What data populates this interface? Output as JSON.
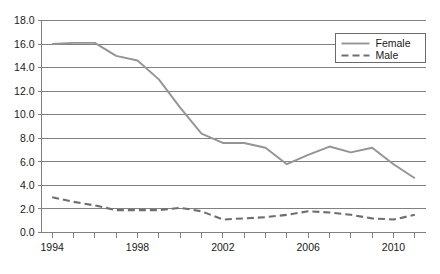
{
  "chart_data": {
    "type": "line",
    "title": "",
    "xlabel": "",
    "ylabel": "",
    "x": [
      1994,
      1995,
      1996,
      1997,
      1998,
      1999,
      2000,
      2001,
      2002,
      2003,
      2004,
      2005,
      2006,
      2007,
      2008,
      2009,
      2010,
      2011
    ],
    "xlim": [
      1993.5,
      2011.5
    ],
    "ylim": [
      0.0,
      18.0
    ],
    "ytick_labels": [
      "0.0",
      "2.0",
      "4.0",
      "6.0",
      "8.0",
      "10.0",
      "12.0",
      "14.0",
      "16.0",
      "18.0"
    ],
    "ytick_values": [
      0.0,
      2.0,
      4.0,
      6.0,
      8.0,
      10.0,
      12.0,
      14.0,
      16.0,
      18.0
    ],
    "xtick_labels": [
      "1994",
      "1998",
      "2002",
      "2006",
      "2010"
    ],
    "xtick_values": [
      1994,
      1998,
      2002,
      2006,
      2010
    ],
    "grid": true,
    "legend_position": "top-right",
    "series": [
      {
        "name": "Female",
        "style": "solid",
        "color": "#949494",
        "values": [
          16.0,
          16.1,
          16.1,
          15.0,
          14.6,
          13.0,
          10.6,
          8.4,
          7.6,
          7.6,
          7.2,
          5.8,
          6.6,
          7.3,
          6.8,
          7.2,
          5.8,
          4.6
        ]
      },
      {
        "name": "Male",
        "style": "dashed",
        "color": "#6e6e6e",
        "values": [
          3.0,
          2.6,
          2.3,
          1.9,
          1.9,
          1.9,
          2.1,
          1.8,
          1.1,
          1.2,
          1.3,
          1.5,
          1.8,
          1.7,
          1.5,
          1.2,
          1.1,
          1.5
        ]
      }
    ]
  },
  "legend": {
    "entries": [
      {
        "label": "Female"
      },
      {
        "label": "Male"
      }
    ]
  }
}
